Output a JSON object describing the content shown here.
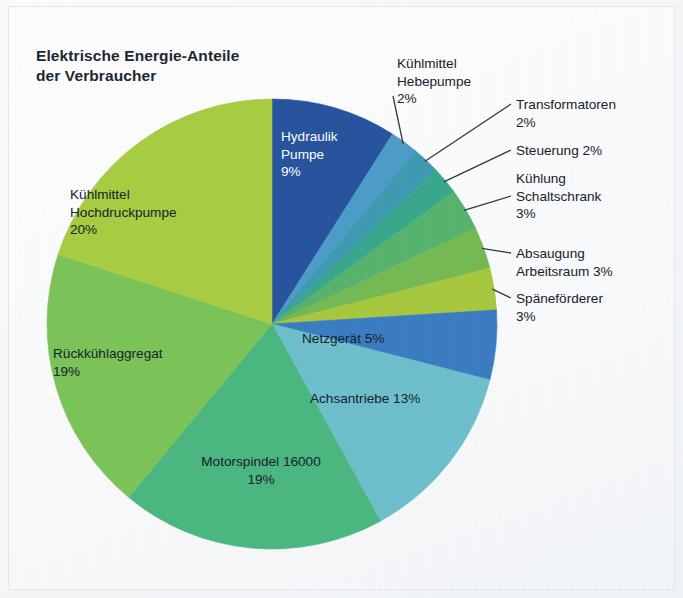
{
  "chart_data": {
    "type": "pie",
    "title": "Elektrische Energie-Anteile\nder Verbraucher",
    "unit": "%",
    "total": 100,
    "start_angle_deg": 0,
    "direction": "clockwise",
    "categories": [
      "Hydraulik Pumpe",
      "Kühlmittel Hebepumpe",
      "Transformatoren",
      "Steuerung",
      "Kühlung Schaltschrank",
      "Absaugung Arbeitsraum",
      "Späneförderer",
      "Netzgerät",
      "Achsantriebe",
      "Motorspindel 16000",
      "Rückkühlaggregat",
      "Kühlmittel Hochdruckpumpe"
    ],
    "values": [
      9,
      2,
      2,
      2,
      3,
      3,
      3,
      5,
      13,
      19,
      19,
      20
    ],
    "colors": [
      "#28559f",
      "#4e9ec9",
      "#3f9cb4",
      "#3aa98f",
      "#58b56f",
      "#76bb55",
      "#a8c93f",
      "#3c7ec4",
      "#6fc1cd",
      "#4cb882",
      "#7cc55a",
      "#a9ce43"
    ],
    "slices": [
      {
        "label": "Hydraulik Pumpe",
        "value": 9,
        "value_text": "9%",
        "color": "#28559f",
        "label_placement": "inside"
      },
      {
        "label": "Kühlmittel Hebepumpe",
        "value": 2,
        "value_text": "2%",
        "color": "#4e9ec9",
        "label_placement": "outside-leader"
      },
      {
        "label": "Transformatoren",
        "value": 2,
        "value_text": "2%",
        "color": "#3f9cb4",
        "label_placement": "outside-leader"
      },
      {
        "label": "Steuerung",
        "value": 2,
        "value_text": "2%",
        "color": "#3aa98f",
        "label_placement": "outside-leader"
      },
      {
        "label": "Kühlung Schaltschrank",
        "value": 3,
        "value_text": "3%",
        "color": "#58b56f",
        "label_placement": "outside-leader"
      },
      {
        "label": "Absaugung Arbeitsraum",
        "value": 3,
        "value_text": "3%",
        "color": "#76bb55",
        "label_placement": "outside-leader"
      },
      {
        "label": "Späneförderer",
        "value": 3,
        "value_text": "3%",
        "color": "#a8c93f",
        "label_placement": "outside-leader"
      },
      {
        "label": "Netzgerät",
        "value": 5,
        "value_text": "5%",
        "color": "#3c7ec4",
        "label_placement": "inside"
      },
      {
        "label": "Achsantriebe",
        "value": 13,
        "value_text": "13%",
        "color": "#6fc1cd",
        "label_placement": "inside"
      },
      {
        "label": "Motorspindel 16000",
        "value": 19,
        "value_text": "19%",
        "color": "#4cb882",
        "label_placement": "inside"
      },
      {
        "label": "Rückkühlaggregat",
        "value": 19,
        "value_text": "19%",
        "color": "#7cc55a",
        "label_placement": "inside"
      },
      {
        "label": "Kühlmittel Hochdruckpumpe",
        "value": 20,
        "value_text": "20%",
        "color": "#a9ce43",
        "label_placement": "inside"
      }
    ],
    "legend": "none",
    "grid": false
  },
  "labels": {
    "hydraulik_pumpe": "Hydraulik\nPumpe\n9%",
    "kuehlmittel_hebepumpe": "Kühlmittel\nHebepumpe\n2%",
    "transformatoren": "Transformatoren\n2%",
    "steuerung": "Steuerung 2%",
    "kuehlung_schaltschrank": "Kühlung\nSchaltschrank\n3%",
    "absaugung_arbeitsraum": "Absaugung\nArbeitsraum 3%",
    "spaenefoerderer": "Späneförderer\n3%",
    "netzgeraet": "Netzgerät 5%",
    "achsantriebe": "Achsantriebe 13%",
    "motorspindel": "Motorspindel 16000\n19%",
    "rueckkuehlaggregat": "Rückkühlaggregat\n19%",
    "kuehlmittel_hochdruckpumpe": "Kühlmittel\nHochdruckpumpe\n20%"
  },
  "style": {
    "leader_line_color": "#2c3a47",
    "background": "#f6f8fa",
    "title_color": "#1c2833"
  }
}
